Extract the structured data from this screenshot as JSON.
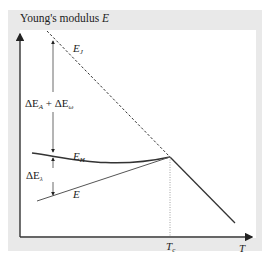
{
  "diagram": {
    "y_axis_label_prefix": "Young's modulus ",
    "y_axis_label_var": "E",
    "x_axis_label": "T",
    "tc_label_main": "T",
    "tc_label_sub": "c",
    "curves": {
      "ej": {
        "main": "E",
        "sub": "J",
        "style": "dashed"
      },
      "eh": {
        "main": "E",
        "sub": "H",
        "style": "solid-curve"
      },
      "e": {
        "main": "E",
        "style": "solid-line"
      }
    },
    "annotations": {
      "upper_gap": {
        "d1": "ΔE",
        "s1": "A",
        "plus": " + ",
        "d2": "ΔE",
        "s2": "ω"
      },
      "lower_gap": {
        "d": "ΔE",
        "s": "λ"
      }
    },
    "colors": {
      "panel_bg": "#e9e9e9",
      "plot_bg": "#ffffff",
      "line": "#333333",
      "guide": "#888888"
    }
  }
}
